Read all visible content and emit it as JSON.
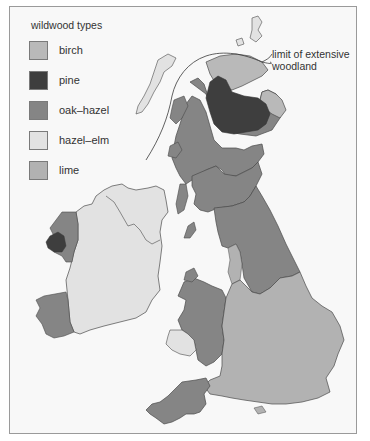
{
  "figure": {
    "type": "thematic map",
    "region": "Britain and Ireland"
  },
  "legend": {
    "title": "wildwood types",
    "items": [
      {
        "label": "birch",
        "color": "#b9b9b9"
      },
      {
        "label": "pine",
        "color": "#3e3e3e"
      },
      {
        "label": "oak–hazel",
        "color": "#858585"
      },
      {
        "label": "hazel–elm",
        "color": "#e2e2e2"
      },
      {
        "label": "lime",
        "color": "#b2b2b2"
      }
    ]
  },
  "annotation": {
    "line1": "limit of extensive",
    "line2": "woodland"
  },
  "colors": {
    "background": "#f8f8f8",
    "frame": "#9a9a9a",
    "coastline": "#4a4a4a",
    "sea": "#f8f8f8"
  }
}
